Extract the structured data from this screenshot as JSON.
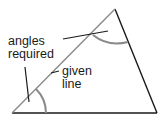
{
  "diagram": {
    "labels": {
      "angles_required_line1": "angles",
      "angles_required_line2": "required",
      "given_line_line1": "given",
      "given_line_line2": "line"
    },
    "colors": {
      "background": "#ffffff",
      "triangle_sides": "#1a1a1a",
      "given_line": "#8a8a8a",
      "angle_arcs": "#8a8a8a",
      "leader_lines": "#1a1a1a",
      "text": "#1a1a1a"
    },
    "shape": "triangle",
    "vertices": {
      "bottom_left": [
        12,
        113
      ],
      "apex": [
        115,
        9
      ],
      "bottom_right": [
        157,
        113
      ]
    }
  }
}
